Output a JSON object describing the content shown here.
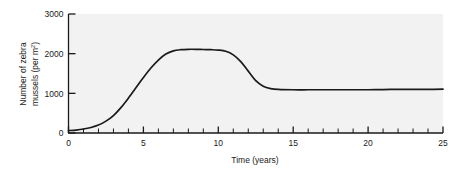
{
  "chart_data": {
    "type": "line",
    "title": "",
    "xlabel": "Time (years)",
    "ylabel": "Number of zebra mussels (per m",
    "ylabel_superscript": "2",
    "ylabel_suffix": ")",
    "xlim": [
      0,
      25
    ],
    "ylim": [
      0,
      3000
    ],
    "grid": false,
    "legend": "none",
    "plot_background": "#f2f2f2",
    "line_color": "#1a1a1a",
    "x_major_ticks": [
      0,
      5,
      10,
      15,
      20,
      25
    ],
    "x_major_tick_labels": [
      "0",
      "5",
      "10",
      "15",
      "20",
      "25"
    ],
    "x_minor_tick_step": 1,
    "y_major_ticks": [
      0,
      1000,
      2000,
      3000
    ],
    "y_major_tick_labels": [
      "0",
      "1000",
      "2000",
      "3000"
    ],
    "tick_direction": "in",
    "series": [
      {
        "name": "zebra mussel density",
        "x": [
          0,
          0.5,
          1,
          1.5,
          2,
          2.5,
          3,
          3.5,
          4,
          4.5,
          5,
          5.5,
          6,
          6.5,
          7,
          7.5,
          8,
          8.5,
          9,
          9.5,
          10,
          10.5,
          11,
          11.5,
          12,
          12.5,
          13,
          13.5,
          14,
          15,
          16,
          17,
          18,
          19,
          20,
          21,
          22,
          23,
          24,
          25
        ],
        "y": [
          60,
          75,
          100,
          140,
          200,
          300,
          440,
          640,
          880,
          1140,
          1400,
          1640,
          1840,
          1990,
          2070,
          2100,
          2110,
          2110,
          2105,
          2100,
          2090,
          2060,
          1970,
          1800,
          1560,
          1320,
          1180,
          1120,
          1100,
          1090,
          1090,
          1090,
          1090,
          1090,
          1090,
          1095,
          1100,
          1100,
          1100,
          1105
        ]
      }
    ],
    "annotations": []
  }
}
